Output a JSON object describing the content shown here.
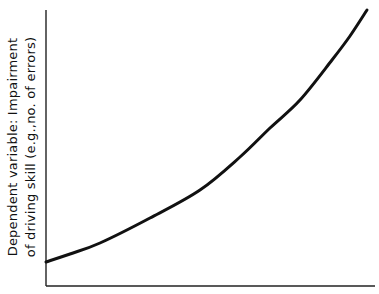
{
  "chart_data": {
    "type": "line",
    "title": "",
    "xlabel": "",
    "ylabel": "Dependent variable: Impairment of driving skill (e.g.,no. of errors)",
    "ylabel_lines": [
      "Dependent  variable: Impairment",
      "of driving skill (e.g.,no. of errors)"
    ],
    "x_ticks": [],
    "y_ticks": [],
    "grid": false,
    "legend": null,
    "series": [
      {
        "name": "impairment",
        "color": "#111111",
        "points_px": [
          [
            46,
            262
          ],
          [
            70,
            254
          ],
          [
            100,
            243
          ],
          [
            150,
            218
          ],
          [
            200,
            190
          ],
          [
            240,
            157
          ],
          [
            270,
            128
          ],
          [
            300,
            100
          ],
          [
            332,
            60
          ],
          [
            350,
            36
          ],
          [
            367,
            10
          ]
        ]
      }
    ],
    "axes_px": {
      "origin": [
        46,
        286
      ],
      "y_top": 10,
      "x_right": 375
    }
  }
}
